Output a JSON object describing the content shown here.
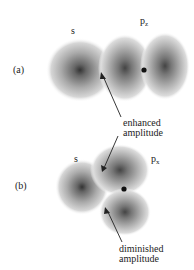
{
  "panel_a": {
    "label": "(a)",
    "s_label": "s",
    "p_label": "p",
    "p_sub": "z",
    "annotation_line1": "enhanced",
    "annotation_line2": "amplitude"
  },
  "panel_b": {
    "label": "(b)",
    "s_label": "s",
    "p_label": "p",
    "p_sub": "x",
    "annotation_line1": "diminished",
    "annotation_line2": "amplitude"
  },
  "colors": {
    "cloud": "#9a9a9a",
    "core": "#222222",
    "text": "#222222"
  }
}
